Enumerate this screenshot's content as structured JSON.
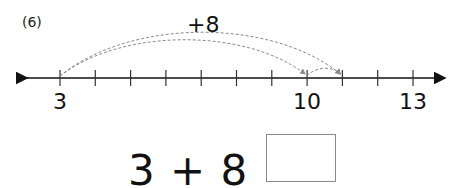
{
  "problem": {
    "number_label": "(6)",
    "jump_label": "+8",
    "equation_text": "3 + 8 =",
    "answer_value": ""
  },
  "number_line": {
    "min": 3,
    "max": 13,
    "labeled_ticks": [
      {
        "value": 3,
        "label": "3"
      },
      {
        "value": 10,
        "label": "10"
      },
      {
        "value": 13,
        "label": "13"
      }
    ],
    "jumps": [
      {
        "from": 3,
        "to": 10,
        "style": "dashed"
      },
      {
        "from": 3,
        "to": 11,
        "style": "dashed"
      },
      {
        "from": 10,
        "to": 11,
        "style": "dashed"
      }
    ],
    "colors": {
      "axis": "#111111",
      "arc": "#8a8a8a"
    }
  }
}
